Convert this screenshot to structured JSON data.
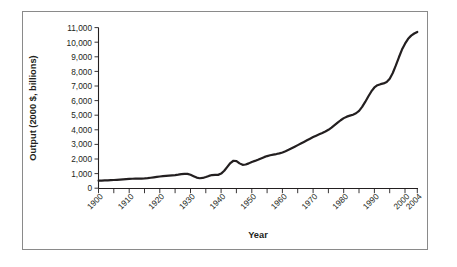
{
  "figure": {
    "background_color": "#ffffff",
    "frame_color": "#8a8a8a",
    "ink_color": "#231f20"
  },
  "axis_titles": {
    "x": "Year",
    "y": "Output (2000 $, billions)"
  },
  "y_tick_labels": [
    "11,000",
    "10,000",
    "9,000",
    "8,000",
    "7,000",
    "6,000",
    "5,000",
    "4,000",
    "3,000",
    "2,000",
    "1,000",
    "0"
  ],
  "x_tick_labels": [
    "1900",
    "1910",
    "1920",
    "1930",
    "1940",
    "1950",
    "1960",
    "1970",
    "1980",
    "1990",
    "2000",
    "2004"
  ],
  "chart_data": {
    "type": "line",
    "title": "",
    "xlabel": "Year",
    "ylabel": "Output (2000 $, billions)",
    "xlim": [
      1900,
      2004
    ],
    "ylim": [
      0,
      11000
    ],
    "y_tick_values": [
      0,
      1000,
      2000,
      3000,
      4000,
      5000,
      6000,
      7000,
      8000,
      9000,
      10000,
      11000
    ],
    "x_tick_values": [
      1900,
      1910,
      1920,
      1930,
      1940,
      1950,
      1960,
      1970,
      1980,
      1990,
      2000,
      2004
    ],
    "x_minor_tick_interval": 5,
    "grid": false,
    "legend": "none",
    "series": [
      {
        "name": "Real GDP",
        "line_color": "#231f20",
        "x": [
          1900,
          1901,
          1902,
          1903,
          1904,
          1905,
          1906,
          1907,
          1908,
          1909,
          1910,
          1911,
          1912,
          1913,
          1914,
          1915,
          1916,
          1917,
          1918,
          1919,
          1920,
          1921,
          1922,
          1923,
          1924,
          1925,
          1926,
          1927,
          1928,
          1929,
          1930,
          1931,
          1932,
          1933,
          1934,
          1935,
          1936,
          1937,
          1938,
          1939,
          1940,
          1941,
          1942,
          1943,
          1944,
          1945,
          1946,
          1947,
          1948,
          1949,
          1950,
          1951,
          1952,
          1953,
          1954,
          1955,
          1956,
          1957,
          1958,
          1959,
          1960,
          1961,
          1962,
          1963,
          1964,
          1965,
          1966,
          1967,
          1968,
          1969,
          1970,
          1971,
          1972,
          1973,
          1974,
          1975,
          1976,
          1977,
          1978,
          1979,
          1980,
          1981,
          1982,
          1983,
          1984,
          1985,
          1986,
          1987,
          1988,
          1989,
          1990,
          1991,
          1992,
          1993,
          1994,
          1995,
          1996,
          1997,
          1998,
          1999,
          2000,
          2001,
          2002,
          2003,
          2004
        ],
        "values": [
          480,
          500,
          520,
          540,
          535,
          575,
          640,
          650,
          600,
          670,
          680,
          700,
          745,
          760,
          700,
          720,
          820,
          800,
          870,
          875,
          865,
          845,
          890,
          1005,
          1035,
          1160,
          1235,
          1245,
          1260,
          1345,
          1230,
          1150,
          1000,
          985,
          1090,
          1190,
          1345,
          1415,
          1365,
          1475,
          1600,
          1880,
          2230,
          2620,
          2820,
          2790,
          2480,
          2460,
          2560,
          2550,
          2770,
          2990,
          3110,
          3250,
          3230,
          3450,
          3520,
          3590,
          3560,
          3810,
          3910,
          4000,
          4240,
          4420,
          4680,
          4980,
          5300,
          5440,
          5700,
          5870,
          5880,
          6070,
          6390,
          6750,
          6720,
          6700,
          7060,
          7380,
          7780,
          8020,
          8000,
          8200,
          8040,
          8400,
          9010,
          9380,
          9710,
          10050,
          10470,
          10850,
          11040,
          11030,
          11400,
          11720,
          12190,
          12500,
          12980,
          13560,
          14150,
          14790,
          15310,
          15470,
          15740,
          16210,
          16800
        ],
        "note": "Values charted on the axis shown run from about 500 (1900) to about 10,700 (2004); the plotted curve follows the drawn path."
      }
    ],
    "plotted_path_points": [
      {
        "year": 1900,
        "value": 520
      },
      {
        "year": 1905,
        "value": 560
      },
      {
        "year": 1910,
        "value": 640
      },
      {
        "year": 1915,
        "value": 670
      },
      {
        "year": 1920,
        "value": 800
      },
      {
        "year": 1925,
        "value": 900
      },
      {
        "year": 1929,
        "value": 980
      },
      {
        "year": 1933,
        "value": 680
      },
      {
        "year": 1937,
        "value": 900
      },
      {
        "year": 1940,
        "value": 1000
      },
      {
        "year": 1944,
        "value": 1880
      },
      {
        "year": 1947,
        "value": 1600
      },
      {
        "year": 1950,
        "value": 1800
      },
      {
        "year": 1955,
        "value": 2200
      },
      {
        "year": 1960,
        "value": 2450
      },
      {
        "year": 1965,
        "value": 2950
      },
      {
        "year": 1970,
        "value": 3500
      },
      {
        "year": 1975,
        "value": 4000
      },
      {
        "year": 1980,
        "value": 4800
      },
      {
        "year": 1985,
        "value": 5300
      },
      {
        "year": 1990,
        "value": 6900
      },
      {
        "year": 1995,
        "value": 7500
      },
      {
        "year": 2000,
        "value": 9900
      },
      {
        "year": 2004,
        "value": 10700
      }
    ]
  }
}
